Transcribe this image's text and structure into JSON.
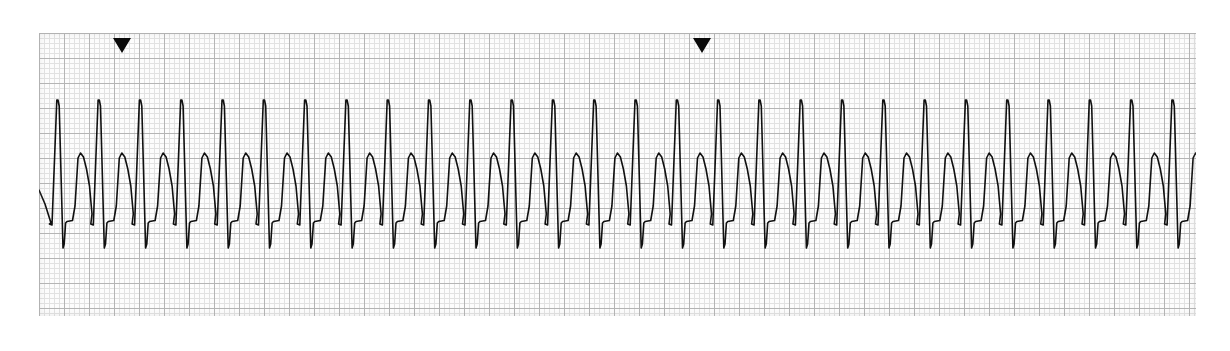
{
  "document": {
    "type": "ecg-rhythm-strip",
    "lead_label": "",
    "background_color": "#ffffff"
  },
  "paper": {
    "x": 39,
    "y": 33,
    "width": 1157,
    "height": 283,
    "background_color": "#fdfdfd",
    "minor_grid_spacing_px": 5,
    "major_grid_spacing_px": 25,
    "minor_grid_color": "#cccccc",
    "major_grid_color": "#a6a6a6"
  },
  "trace": {
    "color": "#101010",
    "line_width": 1.6,
    "baseline_y": 222,
    "r_peak_y": 100,
    "s_trough_y": 248,
    "t_peak_y": 153,
    "rr_interval_px": 41.3,
    "first_r_peak_x": 58,
    "beat_count": 29
  },
  "markers": [
    {
      "name": "beat-marker-1",
      "x": 113,
      "y": 38,
      "glyph": "triangle-down-icon"
    },
    {
      "name": "beat-marker-2",
      "x": 693,
      "y": 38,
      "glyph": "triangle-down-icon"
    }
  ],
  "chart_data": {
    "type": "line",
    "title": "",
    "xlabel": "",
    "ylabel": "",
    "grid": true,
    "legend": "none",
    "series": [
      {
        "name": "ECG",
        "description": "Regular narrow-complex tachycardia: sharp R spike, deep S wave, flat ST segment, broad rounded T wave",
        "beat_count": 29,
        "rr_interval_px": 41.3,
        "amplitudes_px": {
          "baseline": 222,
          "r_peak": 100,
          "s_trough": 248,
          "st_plateau": 222,
          "t_peak": 153
        },
        "beat_offsets_px": {
          "q_start": -6.5,
          "r_peak": 0,
          "s_trough": 5.0,
          "j_point": 7.5,
          "st_end": 14.5,
          "t_peak": 22.5,
          "t_end": 34.0
        }
      }
    ]
  }
}
